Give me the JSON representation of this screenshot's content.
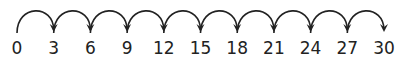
{
  "diagram": {
    "type": "number-line-skip-counting",
    "step": 3,
    "labels": [
      "0",
      "3",
      "6",
      "9",
      "12",
      "15",
      "18",
      "21",
      "24",
      "27",
      "30"
    ],
    "jump_count": 10,
    "stroke_color": "#222222",
    "background": "#ffffff"
  }
}
